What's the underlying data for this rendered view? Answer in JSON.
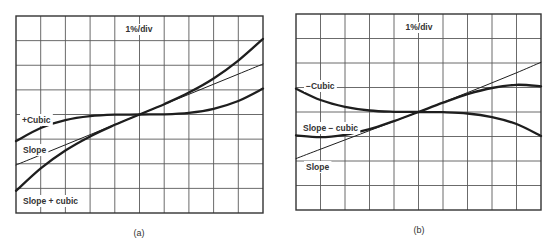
{
  "figure": {
    "panels": [
      {
        "id": "a",
        "caption": "(a)",
        "scale_label": "1%/div",
        "box": {
          "left": 16,
          "top": 16,
          "right": 263,
          "bottom": 213
        },
        "grid": {
          "cols": 10,
          "rows": 8
        },
        "labels": [
          {
            "text": "+Cubic",
            "x": 22,
            "y": 123
          },
          {
            "text": "Slope",
            "x": 23,
            "y": 153
          },
          {
            "text": "Slope + cubic",
            "x": 23,
            "y": 204
          }
        ]
      },
      {
        "id": "b",
        "caption": "(b)",
        "scale_label": "1%/div",
        "box": {
          "left": 296,
          "top": 14,
          "right": 541,
          "bottom": 210
        },
        "grid": {
          "cols": 10,
          "rows": 8
        },
        "labels": [
          {
            "text": "−Cubic",
            "x": 306,
            "y": 89
          },
          {
            "text": "Slope − cubic",
            "x": 303,
            "y": 131
          },
          {
            "text": "Slope",
            "x": 306,
            "y": 170
          }
        ]
      }
    ]
  },
  "chart_data": [
    {
      "type": "line",
      "title": "(a)",
      "subtitle": "1%/div",
      "xlabel": "",
      "ylabel": "",
      "xlim": [
        -5,
        5
      ],
      "ylim": [
        -4,
        4
      ],
      "grid": true,
      "x": [
        -5,
        -4,
        -3,
        -2,
        -1,
        0,
        1,
        2,
        3,
        4,
        5
      ],
      "series": [
        {
          "name": "+Cubic",
          "weight": "bold",
          "values": [
            -1.08,
            -0.55,
            -0.23,
            -0.07,
            -0.01,
            0,
            0.01,
            0.07,
            0.23,
            0.55,
            1.05
          ]
        },
        {
          "name": "Slope",
          "weight": "thin",
          "values": [
            -2.05,
            -1.64,
            -1.23,
            -0.82,
            -0.41,
            0,
            0.41,
            0.82,
            1.23,
            1.64,
            2.05
          ]
        },
        {
          "name": "Slope + cubic",
          "weight": "bold",
          "values": [
            -3.1,
            -2.19,
            -1.46,
            -0.89,
            -0.42,
            0,
            0.42,
            0.89,
            1.46,
            2.19,
            3.07
          ]
        }
      ]
    },
    {
      "type": "line",
      "title": "(b)",
      "subtitle": "1%/div",
      "xlabel": "",
      "ylabel": "",
      "xlim": [
        -5,
        5
      ],
      "ylim": [
        -4,
        4
      ],
      "grid": true,
      "x": [
        -5,
        -4,
        -3,
        -2,
        -1,
        0,
        1,
        2,
        3,
        4,
        5
      ],
      "series": [
        {
          "name": "−Cubic",
          "weight": "bold",
          "values": [
            0.95,
            0.49,
            0.21,
            0.06,
            0.01,
            0,
            -0.01,
            -0.06,
            -0.21,
            -0.49,
            -0.98
          ]
        },
        {
          "name": "Slope",
          "weight": "thin",
          "values": [
            -1.9,
            -1.52,
            -1.14,
            -0.76,
            -0.38,
            0,
            0.39,
            0.79,
            1.19,
            1.6,
            2.03
          ]
        },
        {
          "name": "Slope − cubic",
          "weight": "bold",
          "values": [
            -0.95,
            -1.03,
            -0.93,
            -0.7,
            -0.37,
            0,
            0.38,
            0.73,
            0.98,
            1.11,
            1.05
          ]
        }
      ]
    }
  ]
}
